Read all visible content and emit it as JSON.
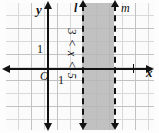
{
  "figure": {
    "background_color": "#fdfdfd",
    "grid_color": "#d9d9d9",
    "axis_color": "#121212",
    "shade_color": "#b6b6b6"
  },
  "axes": {
    "x_label": "x",
    "y_label": "y",
    "origin_label": "O",
    "x_unit_label": "1",
    "y_unit_label": "1",
    "x_arrow_left": "◀",
    "x_arrow_right": "▶",
    "y_arrow_up": "▲",
    "y_arrow_down": "▼"
  },
  "lines": [
    {
      "name": "l",
      "label": "l",
      "style": "dashed",
      "orientation": "vertical",
      "x_value": 3
    },
    {
      "name": "m",
      "label": "m",
      "style": "dashed",
      "orientation": "vertical",
      "x_value": 5
    }
  ],
  "region": {
    "inequality_label": "3 < x < 5",
    "shaded": true,
    "between": [
      "l",
      "m"
    ]
  },
  "chart_data": {
    "type": "line",
    "title": "3 < x < 5",
    "xlabel": "x",
    "ylabel": "y",
    "xlim": [
      -3.5,
      7.5
    ],
    "ylim": [
      -4.5,
      5.0
    ],
    "grid": true,
    "legend": "none",
    "series": [
      {
        "name": "l",
        "type": "vertical-line",
        "x": 3,
        "style": "dashed",
        "label": "l"
      },
      {
        "name": "m",
        "type": "vertical-line",
        "x": 5,
        "style": "dashed",
        "label": "m"
      }
    ],
    "shaded_regions": [
      {
        "label": "3 < x < 5",
        "x_start": 3,
        "x_end": 5,
        "color": "#b6b6b6"
      }
    ],
    "annotations": [
      {
        "text": "O",
        "x": 0,
        "y": 0
      },
      {
        "text": "1",
        "x": 1,
        "y": 0
      },
      {
        "text": "1",
        "x": 0,
        "y": 1
      },
      {
        "text": "l",
        "x": 3,
        "y": 5
      },
      {
        "text": "m",
        "x": 5,
        "y": 5
      },
      {
        "text": "3 < x < 5",
        "x": 4,
        "y": 0,
        "rotation": 90
      }
    ]
  }
}
